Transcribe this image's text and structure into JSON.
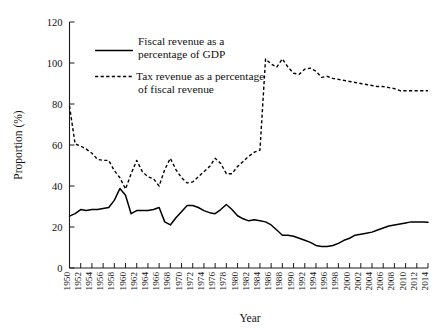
{
  "chart_data": {
    "type": "line",
    "title": "",
    "xlabel": "Year",
    "ylabel": "Proportion (%)",
    "xlim": [
      1950,
      2014
    ],
    "ylim": [
      0,
      120
    ],
    "yticks": [
      0,
      20,
      40,
      60,
      80,
      100,
      120
    ],
    "grid": false,
    "legend_position": "upper-left-inside",
    "x": [
      1950,
      1951,
      1952,
      1953,
      1954,
      1955,
      1956,
      1957,
      1958,
      1959,
      1960,
      1961,
      1962,
      1963,
      1964,
      1965,
      1966,
      1967,
      1968,
      1969,
      1970,
      1971,
      1972,
      1973,
      1974,
      1975,
      1976,
      1977,
      1978,
      1979,
      1980,
      1981,
      1982,
      1983,
      1984,
      1985,
      1986,
      1987,
      1988,
      1989,
      1990,
      1991,
      1992,
      1993,
      1994,
      1995,
      1996,
      1997,
      1998,
      1999,
      2000,
      2001,
      2002,
      2003,
      2004,
      2005,
      2006,
      2007,
      2008,
      2009,
      2010,
      2011,
      2012,
      2013,
      2014
    ],
    "xtick_labels": [
      "1950",
      "1952",
      "1954",
      "1956",
      "1958",
      "1960",
      "1962",
      "1964",
      "1966",
      "1968",
      "1970",
      "1972",
      "1974",
      "1976",
      "1978",
      "1980",
      "1982",
      "1984",
      "1986",
      "1988",
      "1990",
      "1992",
      "1994",
      "1996",
      "1998",
      "2000",
      "2002",
      "2004",
      "2006",
      "2008",
      "2010",
      "2012",
      "2014"
    ],
    "series": [
      {
        "name": "Fiscal revenue as a percentage of GDP",
        "style": "solid",
        "color": "#000000",
        "values": [
          25.3,
          26.5,
          28.5,
          28.0,
          28.5,
          28.5,
          29.0,
          29.5,
          33.0,
          38.8,
          35.5,
          26.5,
          28.0,
          28.0,
          28.0,
          28.5,
          29.5,
          22.5,
          21.0,
          24.5,
          27.5,
          30.5,
          30.5,
          29.5,
          28.0,
          27.0,
          26.5,
          28.5,
          31.0,
          28.5,
          25.5,
          24.0,
          23.0,
          23.5,
          23.0,
          22.5,
          21.0,
          18.5,
          16.0,
          16.0,
          15.5,
          14.5,
          13.5,
          12.5,
          11.0,
          10.5,
          10.5,
          11.0,
          12.0,
          13.5,
          14.5,
          16.0,
          16.5,
          17.0,
          17.5,
          18.5,
          19.5,
          20.5,
          21.0,
          21.5,
          22.0,
          22.5,
          22.5,
          22.5,
          22.3
        ]
      },
      {
        "name": "Tax revenue as a percentage of fiscal revenue",
        "style": "dashed",
        "color": "#000000",
        "values": [
          79.0,
          60.5,
          59.5,
          58.0,
          56.0,
          53.0,
          52.5,
          52.5,
          47.5,
          44.0,
          38.5,
          46.0,
          52.5,
          47.0,
          44.5,
          43.5,
          40.0,
          48.0,
          53.5,
          48.0,
          44.0,
          41.5,
          42.0,
          44.5,
          47.0,
          49.5,
          53.5,
          51.0,
          46.0,
          46.0,
          49.5,
          52.0,
          54.5,
          56.5,
          57.5,
          102.0,
          99.5,
          98.0,
          102.0,
          98.0,
          95.0,
          94.5,
          97.0,
          97.5,
          96.0,
          93.0,
          93.5,
          92.5,
          92.0,
          91.5,
          91.0,
          90.5,
          90.0,
          89.5,
          89.0,
          88.5,
          88.5,
          88.0,
          87.5,
          86.5,
          86.5,
          86.5,
          86.5,
          86.5,
          86.5
        ]
      }
    ]
  },
  "legend": {
    "entries": [
      {
        "line1": "Fiscal revenue as a",
        "line2": "percentage of GDP"
      },
      {
        "line1": "Tax revenue as a percentage",
        "line2": "of fiscal revenue"
      }
    ]
  },
  "axes": {
    "ylabel": "Proportion (%)",
    "xlabel": "Year",
    "ytick_labels": [
      "0",
      "20",
      "40",
      "60",
      "80",
      "100",
      "120"
    ]
  }
}
